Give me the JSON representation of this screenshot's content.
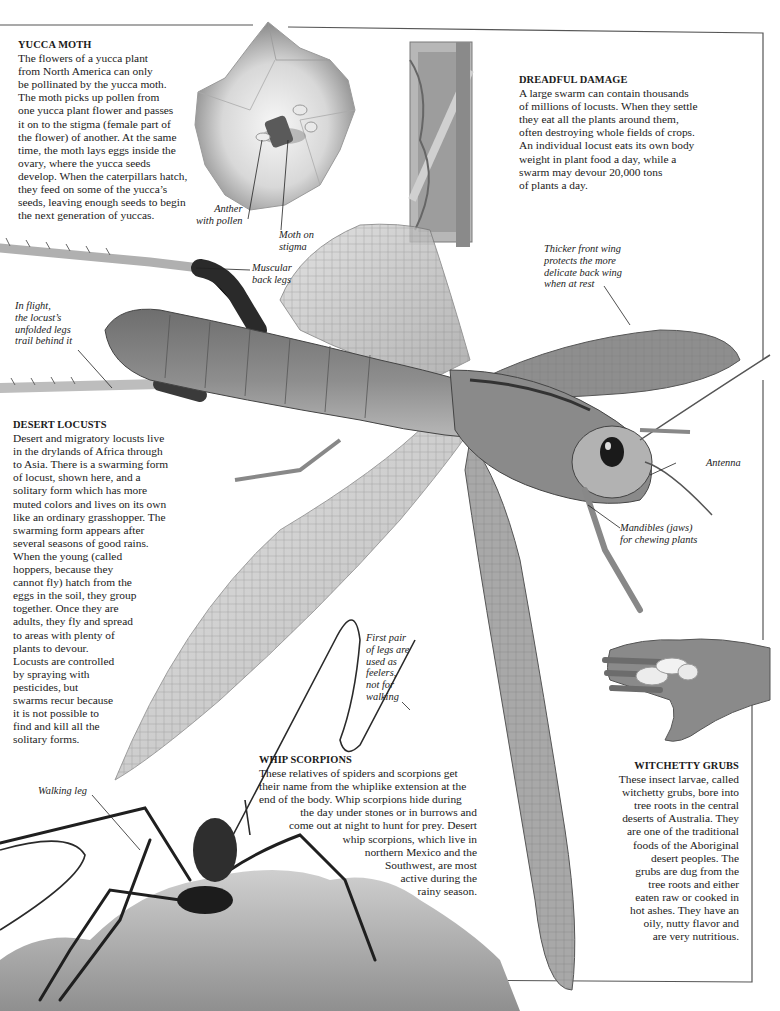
{
  "page": {
    "colors": {
      "text": "#1a1a1a",
      "border": "#555555",
      "background": "#ffffff"
    }
  },
  "sections": {
    "yucca_moth": {
      "title": "YUCCA MOTH",
      "lines": [
        "The flowers of a yucca plant",
        "from North America can only",
        "be pollinated by the yucca moth.",
        "The moth picks up pollen from",
        "one yucca plant flower and passes",
        "it on to the stigma (female part of",
        "the flower) of another. At the same",
        "time, the moth lays eggs inside the",
        "ovary, where the yucca seeds",
        "develop. When the caterpillars hatch,",
        "they feed on some of the yucca’s",
        "seeds, leaving enough seeds to begin",
        "the next generation of yuccas."
      ]
    },
    "dreadful_damage": {
      "title": "DREADFUL DAMAGE",
      "lines": [
        "A large swarm can contain thousands",
        "of millions of locusts. When they settle",
        "they eat all the plants around them,",
        "often destroying whole fields of crops.",
        "An individual locust eats its own body",
        "weight in plant food a day, while a",
        "swarm may devour 20,000 tons",
        "of plants a day."
      ]
    },
    "desert_locusts": {
      "title": "DESERT LOCUSTS",
      "lines": [
        "Desert and migratory locusts live",
        "in the drylands of Africa through",
        "to Asia. There is a swarming form",
        "of locust, shown here, and a",
        "solitary form which has more",
        "muted colors and lives on its own",
        "like an ordinary grasshopper. The",
        "swarming form appears after",
        "several seasons of good rains.",
        "When the young (called",
        "hoppers, because they",
        "cannot fly) hatch from the",
        "eggs in the soil, they group",
        "together. Once they are",
        "adults, they fly and spread",
        "to areas with plenty of",
        "plants to devour.",
        "Locusts are controlled",
        "by spraying with",
        "pesticides, but",
        "swarms recur because",
        "it is not possible to",
        "find and kill all the",
        "solitary forms."
      ]
    },
    "whip_scorpions": {
      "title": "WHIP SCORPIONS",
      "lines": [
        "These relatives of spiders and scorpions get",
        "their name from the whiplike extension at the",
        "end of the body. Whip scorpions hide during",
        "the day under stones or in burrows and",
        "come out at night to hunt for prey. Desert",
        "whip scorpions, which live in",
        "northern Mexico and the",
        "Southwest, are most",
        "active during the",
        "rainy season."
      ]
    },
    "witchetty_grubs": {
      "title": "WITCHETTY GRUBS",
      "lines": [
        "These insect larvae, called",
        "witchetty grubs, bore into",
        "tree roots in the central",
        "deserts of Australia. They",
        "are one of the traditional",
        "foods of the Aboriginal",
        "desert peoples. The",
        "grubs are dug from the",
        "tree roots and either",
        "eaten raw or cooked in",
        "hot ashes. They have an",
        "oily, nutty flavor and",
        "are very nutritious."
      ]
    }
  },
  "labels": {
    "anther": [
      "Anther",
      "with pollen"
    ],
    "moth_on_stigma": [
      "Moth on",
      "stigma"
    ],
    "muscular_back_legs": [
      "Muscular",
      "back legs"
    ],
    "thicker_front_wing": [
      "Thicker front wing",
      "protects the more",
      "delicate back wing",
      "when at rest"
    ],
    "in_flight": [
      "In flight,",
      "the locust’s",
      "unfolded legs",
      "trail behind it"
    ],
    "antenna": [
      "Antenna"
    ],
    "mandibles": [
      "Mandibles (jaws)",
      "for chewing plants"
    ],
    "first_pair_legs": [
      "First pair",
      "of legs are",
      "used as",
      "feelers,",
      "not for",
      "walking"
    ],
    "walking_leg": [
      "Walking leg"
    ]
  },
  "images": [
    {
      "name": "yucca-flower-photo",
      "description": "Yucca flower with moth on stigma"
    },
    {
      "name": "damaged-crate-photo",
      "description": "Wooden frame covered with locusts"
    },
    {
      "name": "desert-locust-photo",
      "description": "Desert locust in flight with wings spread"
    },
    {
      "name": "witchetty-grubs-photo",
      "description": "Hand holding witchetty grubs"
    },
    {
      "name": "whip-scorpion-photo",
      "description": "Whip scorpion on a rock"
    }
  ]
}
